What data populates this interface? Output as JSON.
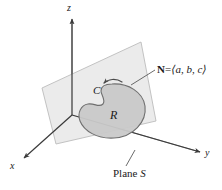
{
  "figure": {
    "axes": {
      "z_label": "z",
      "x_label": "x",
      "y_label": "y"
    },
    "labels": {
      "curve": "C",
      "region": "R",
      "normal_bold": "N",
      "normal_equals": "=",
      "normal_components": "⟨a, b, c⟩",
      "plane_word": "Plane",
      "plane_symbol": "S"
    },
    "colors": {
      "background": "#ffffff",
      "plane_fill": "#e9e9e9",
      "plane_stroke": "#b9b9b9",
      "region_fill": "#c9c9c9",
      "region_stroke": "#6f6f6f",
      "axis_stroke": "#3a3a3a",
      "leader_stroke": "#5a5a5a",
      "text": "#1a1a1a"
    }
  }
}
